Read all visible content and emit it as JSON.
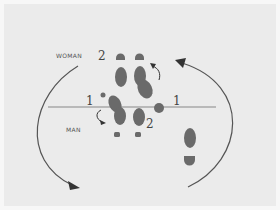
{
  "diagram": {
    "labels": {
      "woman": "WOMAN",
      "man": "MAN",
      "woman_step": "2",
      "man_step": "2",
      "left_step": "1",
      "right_step": "1"
    },
    "colors": {
      "background": "#ebebeb",
      "footprint": "#6a6a6a",
      "line": "#a8a8a8",
      "arrow": "#555555",
      "text": "#555555"
    }
  }
}
